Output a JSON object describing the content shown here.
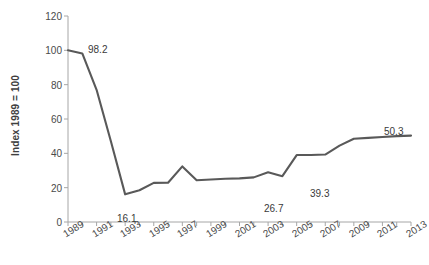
{
  "chart_data": {
    "type": "line",
    "title": "",
    "xlabel": "",
    "ylabel": "Index 1989 = 100",
    "ylim": [
      0,
      120
    ],
    "yticks": [
      0,
      20,
      40,
      60,
      80,
      100,
      120
    ],
    "ytick_labels": [
      "0",
      "20",
      "40",
      "60",
      "80",
      "100",
      "120"
    ],
    "grid": false,
    "legend": "none",
    "line_color": "#595959",
    "x": [
      1989,
      1990,
      1991,
      1992,
      1993,
      1994,
      1995,
      1996,
      1997,
      1998,
      1999,
      2000,
      2001,
      2002,
      2003,
      2004,
      2005,
      2006,
      2007,
      2008,
      2009,
      2010,
      2011,
      2012,
      2013
    ],
    "xtick_labels": [
      "1989",
      "1991",
      "1993",
      "1995",
      "1997",
      "1999",
      "2001",
      "2003",
      "2005",
      "2007",
      "2009",
      "2011",
      "2013"
    ],
    "values": [
      100.0,
      98.2,
      77.0,
      47.0,
      16.1,
      18.5,
      22.8,
      22.9,
      32.4,
      24.3,
      24.8,
      25.2,
      25.4,
      26.0,
      29.0,
      26.7,
      39.0,
      39.0,
      39.3,
      44.5,
      48.5,
      49.0,
      49.5,
      50.0,
      50.3
    ],
    "annotations": [
      {
        "text": "98.2",
        "x": 1990,
        "y": 98.2,
        "px": 88,
        "py": 44
      },
      {
        "text": "16.1",
        "x": 1993,
        "y": 16.1,
        "px": 117,
        "py": 213
      },
      {
        "text": "26.7",
        "x": 2004,
        "y": 26.7,
        "px": 264,
        "py": 203
      },
      {
        "text": "39.3",
        "x": 2007,
        "y": 39.3,
        "px": 310,
        "py": 188
      },
      {
        "text": "50.3",
        "x": 2013,
        "y": 50.3,
        "px": 384,
        "py": 126
      }
    ]
  }
}
